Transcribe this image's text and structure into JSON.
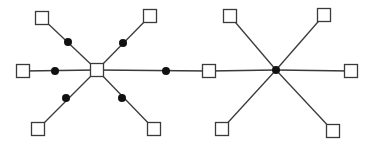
{
  "diagram": {
    "type": "graph",
    "colors": {
      "stroke": "#3a3a3a",
      "dot": "#111111",
      "square_fill": "#ffffff",
      "background": "#ffffff"
    },
    "square_size": 13,
    "dot_radius": 4,
    "nodes": [
      {
        "id": "L-center",
        "shape": "square",
        "x": 97,
        "y": 70
      },
      {
        "id": "L-tl",
        "shape": "square",
        "x": 42,
        "y": 18
      },
      {
        "id": "L-tr",
        "shape": "square",
        "x": 150,
        "y": 16
      },
      {
        "id": "L-l",
        "shape": "square",
        "x": 23,
        "y": 71
      },
      {
        "id": "L-bl",
        "shape": "square",
        "x": 38,
        "y": 129
      },
      {
        "id": "L-br",
        "shape": "square",
        "x": 154,
        "y": 129
      },
      {
        "id": "L-dot-tl",
        "shape": "dot",
        "x": 68,
        "y": 42
      },
      {
        "id": "L-dot-tr",
        "shape": "dot",
        "x": 123,
        "y": 43
      },
      {
        "id": "L-dot-l",
        "shape": "dot",
        "x": 55,
        "y": 71
      },
      {
        "id": "L-dot-bl",
        "shape": "dot",
        "x": 66,
        "y": 98
      },
      {
        "id": "L-dot-br",
        "shape": "dot",
        "x": 122,
        "y": 98
      },
      {
        "id": "bridge-dot",
        "shape": "dot",
        "x": 166,
        "y": 71
      },
      {
        "id": "R-l",
        "shape": "square",
        "x": 209,
        "y": 71
      },
      {
        "id": "R-center",
        "shape": "dot",
        "x": 276,
        "y": 70
      },
      {
        "id": "R-tl",
        "shape": "square",
        "x": 230,
        "y": 16
      },
      {
        "id": "R-tr",
        "shape": "square",
        "x": 324,
        "y": 15
      },
      {
        "id": "R-r",
        "shape": "square",
        "x": 351,
        "y": 71
      },
      {
        "id": "R-bl",
        "shape": "square",
        "x": 222,
        "y": 129
      },
      {
        "id": "R-br",
        "shape": "square",
        "x": 333,
        "y": 131
      }
    ],
    "edges": [
      [
        "L-center",
        "L-tl"
      ],
      [
        "L-center",
        "L-tr"
      ],
      [
        "L-center",
        "L-l"
      ],
      [
        "L-center",
        "L-bl"
      ],
      [
        "L-center",
        "L-br"
      ],
      [
        "L-center",
        "R-l"
      ],
      [
        "R-center",
        "R-l"
      ],
      [
        "R-center",
        "R-tl"
      ],
      [
        "R-center",
        "R-tr"
      ],
      [
        "R-center",
        "R-r"
      ],
      [
        "R-center",
        "R-bl"
      ],
      [
        "R-center",
        "R-br"
      ]
    ]
  }
}
